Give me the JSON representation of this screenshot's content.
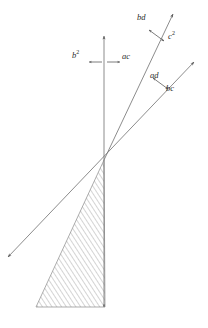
{
  "figure": {
    "title": "",
    "background_color": "#ffffff",
    "line_color": "#6e6e6e",
    "hatch_color": "#9a9a9a",
    "label_color": "#2b2b2b",
    "origin": {
      "x": 104,
      "y": 160
    }
  },
  "labels": {
    "bd": "bd",
    "c_squared": "c",
    "c_squared_exp": "2",
    "ad": "ad",
    "bc": "bc",
    "b_squared": "b",
    "b_squared_exp": "2",
    "ac": "ac"
  },
  "geometry": {
    "vertical_axis": {
      "name": "vertical-axis",
      "from": {
        "x": 104,
        "y": 307
      },
      "to": {
        "x": 104,
        "y": 36
      },
      "arrow_top": true,
      "arrow_bottom": true
    },
    "ray_bd": {
      "name": "ray-bd",
      "from": {
        "x": 104,
        "y": 160
      },
      "to": {
        "x": 173,
        "y": 14
      },
      "arrow_end": true
    },
    "ray_ad_bc": {
      "name": "ray-ad-bc",
      "from": {
        "x": 8,
        "y": 257
      },
      "to": {
        "x": 194,
        "y": 62
      },
      "arrow_start": true,
      "arrow_end": true
    },
    "hatched_triangle": {
      "name": "hatched-triangle",
      "apex": {
        "x": 104,
        "y": 160
      },
      "bottom_left": {
        "x": 36,
        "y": 307
      },
      "bottom_right": {
        "x": 105,
        "y": 307
      }
    },
    "marker_horizontal": {
      "name": "horizontal-double-arrow",
      "left_tip": {
        "x": 89,
        "y": 62
      },
      "right_tip": {
        "x": 119,
        "y": 62
      }
    },
    "marker_bd_cross": {
      "name": "bd-cross-double-arrow",
      "from": {
        "x": 149,
        "y": 30
      },
      "to": {
        "x": 164,
        "y": 40
      }
    },
    "marker_ad_cross": {
      "name": "ad-cross-double-arrow",
      "from": {
        "x": 153,
        "y": 79
      },
      "to": {
        "x": 168,
        "y": 89
      }
    }
  },
  "label_positions": {
    "bd": {
      "x": 137,
      "y": 18
    },
    "c_squared": {
      "x": 168,
      "y": 36
    },
    "ad": {
      "x": 152,
      "y": 76
    },
    "bc": {
      "x": 166,
      "y": 88
    },
    "b_squared": {
      "x": 72,
      "y": 55
    },
    "ac": {
      "x": 121,
      "y": 56
    }
  }
}
